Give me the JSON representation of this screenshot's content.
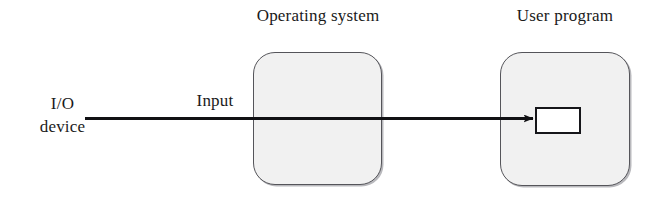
{
  "diagram": {
    "background_color": "#ffffff",
    "labels": {
      "os_box": "Operating system",
      "user_program_box": "User program",
      "source_line1": "I/O",
      "source_line2": "device",
      "flow": "Input"
    },
    "nodes": [
      {
        "name": "operating-system-box",
        "label": "Operating system",
        "shape": "rounded-rectangle",
        "fill_color": "#f1f1f1",
        "border_color": "#55555a"
      },
      {
        "name": "user-program-box",
        "label": "User program",
        "shape": "rounded-rectangle",
        "fill_color": "#f1f1f1",
        "border_color": "#55555a"
      },
      {
        "name": "buffer-rectangle",
        "label": "",
        "shape": "rectangle",
        "fill_color": "#ffffff",
        "border_color": "#16161a"
      }
    ],
    "edges": [
      {
        "name": "input-arrow",
        "label": "Input",
        "from": "I/O device",
        "to": "buffer-rectangle",
        "direction": "right",
        "color": "#111114"
      }
    ]
  }
}
